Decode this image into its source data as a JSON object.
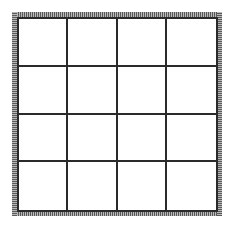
{
  "board": {
    "rows": 4,
    "cols": 4,
    "cells": [
      [
        "",
        "",
        "",
        ""
      ],
      [
        "",
        "",
        "",
        ""
      ],
      [
        "",
        "",
        "",
        ""
      ],
      [
        "",
        "",
        "",
        ""
      ]
    ]
  },
  "colors": {
    "background": "#ffffff",
    "grid_line": "#2a2a2a",
    "frame_hatch_dark": "#5a5a5a",
    "frame_hatch_light": "#b8b8b8"
  }
}
